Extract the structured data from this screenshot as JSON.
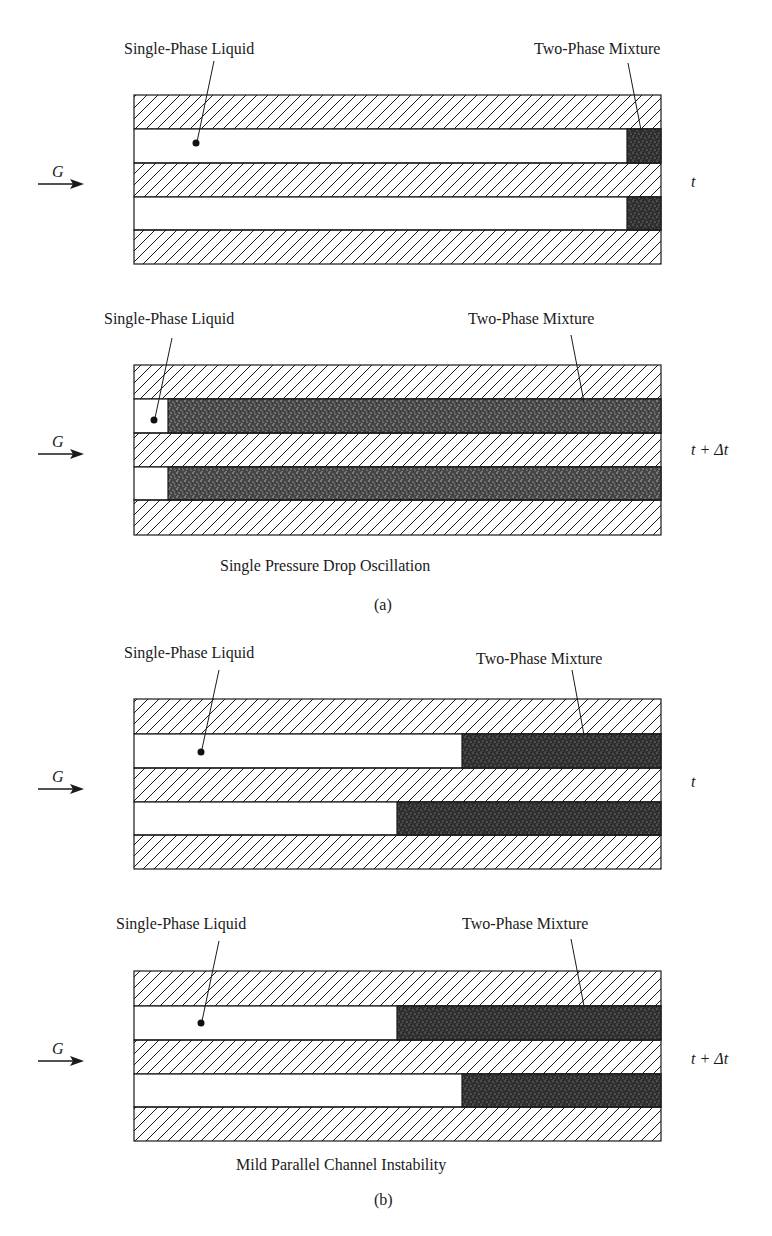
{
  "figure": {
    "panel_a": {
      "caption": "Single Pressure Drop Oscillation",
      "tag": "(a)",
      "state_t": {
        "time_label": "t",
        "flow_label": "G",
        "liquid_label": "Single-Phase Liquid",
        "mixture_label": "Two-Phase Mixture",
        "channels": [
          {
            "liquid_end_x": 627
          },
          {
            "liquid_end_x": 627
          }
        ]
      },
      "state_t_dt": {
        "time_label": "t + Δt",
        "flow_label": "G",
        "liquid_label": "Single-Phase Liquid",
        "mixture_label": "Two-Phase Mixture",
        "channels": [
          {
            "liquid_end_x": 168
          },
          {
            "liquid_end_x": 168
          }
        ]
      }
    },
    "panel_b": {
      "caption": "Mild Parallel Channel Instability",
      "tag": "(b)",
      "state_t": {
        "time_label": "t",
        "flow_label": "G",
        "liquid_label": "Single-Phase Liquid",
        "mixture_label": "Two-Phase Mixture",
        "channels": [
          {
            "liquid_end_x": 462
          },
          {
            "liquid_end_x": 397
          }
        ]
      },
      "state_t_dt": {
        "time_label": "t + Δt",
        "flow_label": "G",
        "liquid_label": "Single-Phase Liquid",
        "mixture_label": "Two-Phase Mixture",
        "channels": [
          {
            "liquid_end_x": 397
          },
          {
            "liquid_end_x": 462
          }
        ]
      }
    },
    "colors": {
      "line": "#1a1a1a",
      "mixture": "#3a3a3a"
    }
  }
}
